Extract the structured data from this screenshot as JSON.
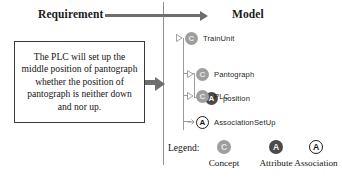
{
  "headings": {
    "requirement": "Requirement",
    "model": "Model"
  },
  "requirement": {
    "text": "The PLC will set up the middle position of pantograph whether the position of pantograph is neither down and nor up."
  },
  "arrows": {
    "top": "transform-arrow-right",
    "middle": "maps-to-arrow-right"
  },
  "tree": {
    "nodes": [
      {
        "label": "TrainUnit",
        "kind": "C",
        "kind_name": "concept",
        "level": 0
      },
      {
        "label": "Pantograph",
        "kind": "C",
        "kind_name": "concept",
        "level": 1
      },
      {
        "label": "position",
        "kind": "A",
        "kind_name": "attribute",
        "level": 2
      },
      {
        "label": "PLC",
        "kind": "C",
        "kind_name": "concept",
        "level": 1
      },
      {
        "label": "AssociationSetUp",
        "kind": "A",
        "kind_name": "association",
        "level": 1
      }
    ]
  },
  "legend": {
    "title": "Legend:",
    "items": [
      {
        "glyph": "C",
        "caption": "Concept",
        "kind_name": "concept"
      },
      {
        "glyph": "A",
        "caption": "Attribute",
        "kind_name": "attribute"
      },
      {
        "glyph": "A",
        "caption": "Association",
        "kind_name": "association"
      }
    ]
  },
  "colors": {
    "concept": "#9e9e9e",
    "attribute": "#4a4a4a",
    "association_stroke": "#1d1d1d",
    "arrow": "#6e6e6e",
    "divider": "#8f8f8f",
    "tree_line": "#9a9a9a",
    "box_border": "#3a3a3a"
  }
}
